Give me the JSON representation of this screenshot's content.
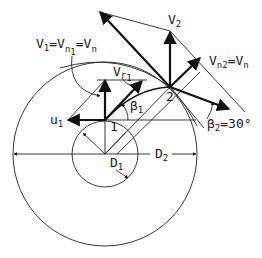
{
  "diagram": {
    "labels": {
      "v1_eq": "V",
      "v1_sub": "1",
      "v1_mid": "=V",
      "v1_n_sub": "n",
      "v1_n_sub2": "1",
      "v1_end": "=V",
      "v1_end_sub": "n",
      "vr1": "V",
      "vr1_sub": "r",
      "vr1_sub2": "1",
      "u1": "u",
      "u1_sub": "1",
      "beta1": "β",
      "beta1_sub": "1",
      "point1": "1",
      "point2": "2",
      "v2": "V",
      "v2_sub": "2",
      "vn2": "V",
      "vn2_sub": "n2",
      "vn2_eq": "=V",
      "vn2_eq_sub": "n",
      "beta2": "β",
      "beta2_sub": "2",
      "beta2_val": "=30°",
      "d1": "D",
      "d1_sub": "1",
      "d2": "D",
      "d2_sub": "2"
    },
    "geometry": {
      "center": [
        105,
        154
      ],
      "outer_radius": 92,
      "inner_radius": 33,
      "point1": [
        105,
        120
      ],
      "point2": [
        170,
        87
      ],
      "beta2_deg": 30
    },
    "colors": {
      "stroke": "#111111",
      "background": "#ffffff"
    }
  }
}
